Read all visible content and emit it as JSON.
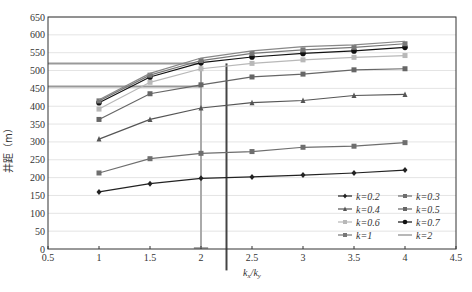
{
  "chart_data": {
    "type": "line",
    "title": "",
    "xlabel": "kx/ky",
    "ylabel": "井距（m）",
    "xlim": [
      0.5,
      4.5
    ],
    "ylim": [
      0,
      650
    ],
    "x_ticks": [
      "0.5",
      "1",
      "1.5",
      "2",
      "2.5",
      "3",
      "3.5",
      "4",
      "4.5"
    ],
    "y_ticks": [
      "0",
      "50",
      "100",
      "150",
      "200",
      "250",
      "300",
      "350",
      "400",
      "450",
      "500",
      "550",
      "600",
      "650"
    ],
    "grid": "horizontal",
    "legend_position": "lower right inside",
    "x": [
      1,
      1.5,
      2,
      2.5,
      3,
      3.5,
      4
    ],
    "series": [
      {
        "name": "k=0.2",
        "marker": "diamond",
        "color": "#222222",
        "values": [
          160,
          183,
          198,
          202,
          207,
          213,
          221
        ]
      },
      {
        "name": "k=0.3",
        "marker": "square",
        "color": "#6e6e6e",
        "values": [
          213,
          253,
          268,
          273,
          285,
          288,
          298
        ]
      },
      {
        "name": "k=0.4",
        "marker": "triangle",
        "color": "#555555",
        "values": [
          308,
          363,
          395,
          410,
          416,
          430,
          433
        ]
      },
      {
        "name": "k=0.5",
        "marker": "square",
        "color": "#666666",
        "values": [
          363,
          435,
          460,
          482,
          490,
          502,
          505
        ]
      },
      {
        "name": "k=0.6",
        "marker": "square",
        "color": "#b8b8b8",
        "values": [
          392,
          467,
          505,
          520,
          530,
          537,
          542
        ]
      },
      {
        "name": "k=0.7",
        "marker": "circle",
        "color": "#111111",
        "values": [
          410,
          482,
          522,
          538,
          548,
          555,
          565
        ]
      },
      {
        "name": "k=1",
        "marker": "square",
        "color": "#777777",
        "values": [
          415,
          487,
          528,
          548,
          558,
          565,
          575
        ]
      },
      {
        "name": "k=2",
        "marker": "none",
        "color": "#888888",
        "values": [
          418,
          492,
          535,
          555,
          567,
          572,
          582
        ]
      }
    ],
    "annotations": [
      {
        "type": "hline",
        "y": 520,
        "x_from": 0.5,
        "x_to": 2.0,
        "color": "#999999"
      },
      {
        "type": "hline",
        "y": 455,
        "x_from": 0.5,
        "x_to": 2.0,
        "color": "#999999"
      },
      {
        "type": "vline",
        "x": 2.0,
        "y_from": 0,
        "y_to": 520,
        "color": "#aaaaaa"
      },
      {
        "type": "vline",
        "x": 2.25,
        "y_from": -60,
        "y_to": 520,
        "color": "#444444"
      }
    ],
    "caption": ""
  },
  "labels": {
    "ylabel": "井距（m）",
    "xlabel_main": "k",
    "xlabel_sub1": "x",
    "xlabel_sep": "/k",
    "xlabel_sub2": "y"
  }
}
